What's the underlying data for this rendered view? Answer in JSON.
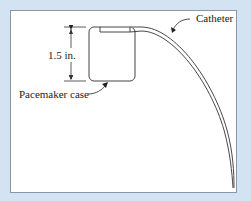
{
  "figure": {
    "labels": {
      "dimension": "1.5 in.",
      "catheter": "Catheter",
      "pacemaker_case": "Pacemaker case"
    },
    "colors": {
      "background": "#d4e3f1",
      "panel": "#ffffff",
      "panel_border": "#8a97ab",
      "line": "#333333"
    }
  }
}
